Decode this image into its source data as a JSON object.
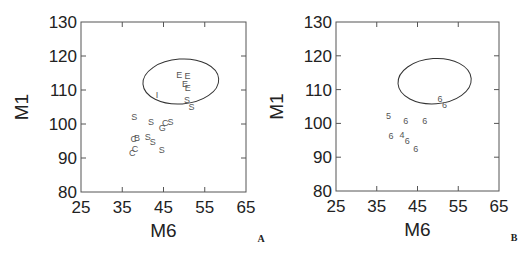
{
  "chart_data": [
    {
      "type": "scatter",
      "panel_label": "A",
      "xlabel": "M6",
      "ylabel": "M1",
      "xlim": [
        25,
        65
      ],
      "ylim": [
        80,
        130
      ],
      "xticks": [
        25,
        35,
        45,
        55,
        65
      ],
      "yticks": [
        80,
        90,
        100,
        110,
        120,
        130
      ],
      "grid": false,
      "frame": {
        "x0": 81,
        "x1": 246,
        "y0": 22,
        "y1": 192
      },
      "ellipse": {
        "cx": 49.2,
        "cy": 112.5,
        "rx_units": 9.2,
        "ry_units": 6.6
      },
      "points": [
        {
          "label": "E",
          "x": 48.8,
          "y": 114.4
        },
        {
          "label": "E",
          "x": 50.8,
          "y": 114.2
        },
        {
          "label": "E",
          "x": 50.2,
          "y": 111.7
        },
        {
          "label": "E",
          "x": 50.9,
          "y": 110.5
        },
        {
          "label": "I",
          "x": 43.4,
          "y": 108.5
        },
        {
          "label": "S",
          "x": 50.7,
          "y": 107.1
        },
        {
          "label": "S",
          "x": 51.8,
          "y": 105.1
        },
        {
          "label": "S",
          "x": 37.9,
          "y": 102.1
        },
        {
          "label": "S",
          "x": 42.0,
          "y": 100.7
        },
        {
          "label": "G",
          "x": 44.7,
          "y": 98.9
        },
        {
          "label": "C",
          "x": 45.4,
          "y": 100.2
        },
        {
          "label": "S",
          "x": 46.7,
          "y": 100.5
        },
        {
          "label": "C",
          "x": 37.8,
          "y": 95.5
        },
        {
          "label": "B",
          "x": 38.6,
          "y": 96.0
        },
        {
          "label": "S",
          "x": 41.2,
          "y": 96.3
        },
        {
          "label": "S",
          "x": 42.4,
          "y": 94.8
        },
        {
          "label": "S",
          "x": 44.6,
          "y": 92.4
        },
        {
          "label": "C",
          "x": 37.4,
          "y": 91.4
        },
        {
          "label": "C",
          "x": 38.1,
          "y": 92.6
        }
      ]
    },
    {
      "type": "scatter",
      "panel_label": "B",
      "xlabel": "M6",
      "ylabel": "M1",
      "xlim": [
        25,
        65
      ],
      "ylim": [
        80,
        130
      ],
      "xticks": [
        25,
        35,
        45,
        55,
        65
      ],
      "yticks": [
        80,
        90,
        100,
        110,
        120,
        130
      ],
      "grid": false,
      "frame": {
        "x0": 336,
        "x1": 499,
        "y0": 22,
        "y1": 191
      },
      "ellipse": {
        "cx": 49.2,
        "cy": 112.5,
        "rx_units": 9.0,
        "ry_units": 6.7
      },
      "points": [
        {
          "label": "6",
          "x": 50.5,
          "y": 107.2
        },
        {
          "label": "6",
          "x": 51.6,
          "y": 105.4
        },
        {
          "label": "5",
          "x": 37.9,
          "y": 102.3
        },
        {
          "label": "6",
          "x": 42.1,
          "y": 100.7
        },
        {
          "label": "6",
          "x": 46.8,
          "y": 100.7
        },
        {
          "label": "6",
          "x": 38.5,
          "y": 96.4
        },
        {
          "label": "4",
          "x": 41.2,
          "y": 96.6
        },
        {
          "label": "6",
          "x": 42.5,
          "y": 94.8
        },
        {
          "label": "6",
          "x": 44.6,
          "y": 92.4
        }
      ]
    }
  ],
  "colors": {
    "axis": "#555555",
    "text": "#222222",
    "points": "#555555",
    "ellipse": "#333333",
    "background": "#ffffff"
  }
}
